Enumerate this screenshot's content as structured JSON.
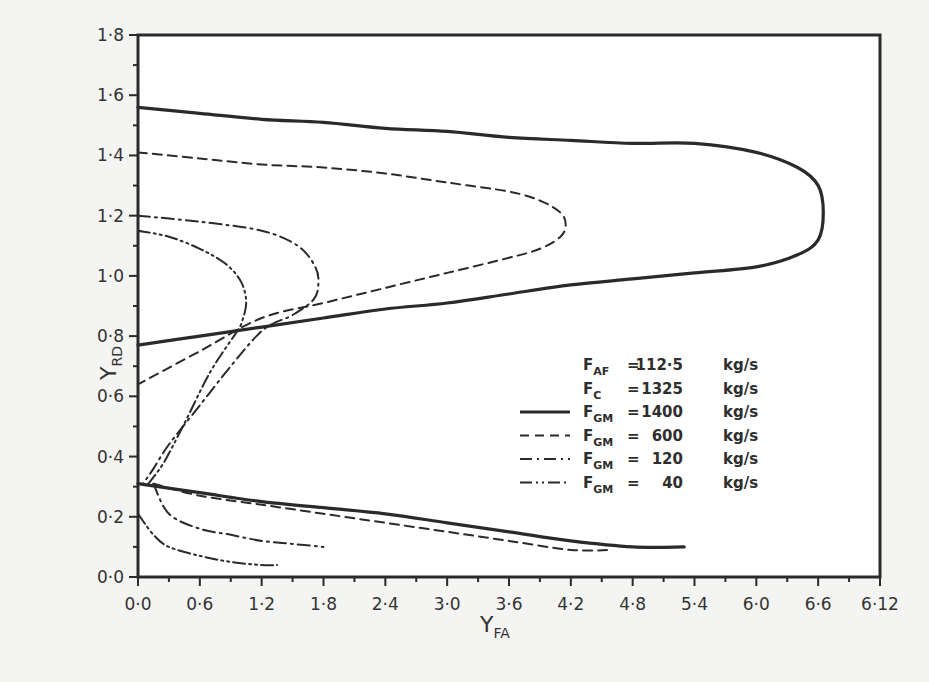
{
  "chart_data": {
    "type": "line",
    "title": "",
    "xlabel": "Y_FA",
    "xlabel_main": "Y",
    "xlabel_sub": "FA",
    "ylabel": "Y_RD",
    "ylabel_main": "Y",
    "ylabel_sub": "RD",
    "xlim": [
      0.0,
      6.12
    ],
    "ylim": [
      0.0,
      1.8
    ],
    "grid": false,
    "legend_position": "inside-right-middle",
    "x_ticks": [
      "0.0",
      "0.6",
      "1.2",
      "1.8",
      "2.4",
      "3.0",
      "3.6",
      "4.2",
      "4.8",
      "5.4",
      "6.0",
      "6.6",
      "6.12"
    ],
    "y_ticks": [
      "0.0",
      "0.2",
      "0.4",
      "0.6",
      "0.8",
      "1.0",
      "1.2",
      "1.4",
      "1.6",
      "1.8"
    ],
    "x_tick_labels_display": [
      "0·0",
      "0·6",
      "1·2",
      "1·8",
      "2·4",
      "3·0",
      "3·6",
      "4·2",
      "4·8",
      "5·4",
      "6·0",
      "6·6",
      "6·12"
    ],
    "y_tick_labels_display": [
      "0·0",
      "0·2",
      "0·4",
      "0·6",
      "0·8",
      "1·0",
      "1·2",
      "1·4",
      "1·6",
      "1·8"
    ],
    "parameters": [
      {
        "symbol": "F",
        "sub": "AF",
        "value": "112·5",
        "unit": "kg/s"
      },
      {
        "symbol": "F",
        "sub": "C",
        "value": "1325",
        "unit": "kg/s"
      }
    ],
    "series": [
      {
        "name": "F_GM = 1400 kg/s",
        "label_value": "1400",
        "style": "solid",
        "branches": [
          {
            "x": [
              0.0,
              0.6,
              1.2,
              1.8,
              2.4,
              3.0,
              3.6,
              4.2,
              4.8,
              5.4,
              6.0,
              6.4,
              6.6,
              6.65,
              6.6,
              6.4,
              6.0,
              5.4,
              4.8,
              4.2,
              3.6,
              3.0,
              2.4,
              1.8,
              1.2,
              0.6,
              0.0
            ],
            "y": [
              1.56,
              1.54,
              1.52,
              1.51,
              1.49,
              1.48,
              1.46,
              1.45,
              1.44,
              1.44,
              1.41,
              1.36,
              1.3,
              1.21,
              1.12,
              1.07,
              1.03,
              1.01,
              0.99,
              0.97,
              0.94,
              0.91,
              0.89,
              0.86,
              0.83,
              0.8,
              0.77
            ]
          },
          {
            "x": [
              0.0,
              0.6,
              1.2,
              1.8,
              2.4,
              3.0,
              3.6,
              4.2,
              4.8,
              5.3
            ],
            "y": [
              0.31,
              0.28,
              0.25,
              0.23,
              0.21,
              0.18,
              0.15,
              0.12,
              0.1,
              0.1
            ]
          }
        ]
      },
      {
        "name": "F_GM = 600 kg/s",
        "label_value": "600",
        "style": "dashed",
        "branches": [
          {
            "x": [
              0.0,
              0.6,
              1.2,
              1.8,
              2.4,
              3.0,
              3.6,
              3.9,
              4.1,
              4.15,
              4.1,
              3.9,
              3.6,
              3.0,
              2.4,
              1.8,
              1.2,
              0.6,
              0.0
            ],
            "y": [
              1.41,
              1.39,
              1.37,
              1.36,
              1.34,
              1.31,
              1.28,
              1.25,
              1.21,
              1.17,
              1.13,
              1.09,
              1.06,
              1.01,
              0.96,
              0.91,
              0.86,
              0.75,
              0.64
            ]
          },
          {
            "x": [
              0.15,
              0.6,
              1.2,
              1.8,
              2.4,
              3.0,
              3.6,
              4.2,
              4.6
            ],
            "y": [
              0.31,
              0.27,
              0.24,
              0.21,
              0.18,
              0.15,
              0.12,
              0.09,
              0.09
            ]
          }
        ]
      },
      {
        "name": "F_GM = 120 kg/s",
        "label_value": "120",
        "style": "dash-dot",
        "branches": [
          {
            "x": [
              0.0,
              0.6,
              1.2,
              1.55,
              1.72,
              1.75,
              1.7,
              1.5,
              1.3,
              1.15,
              0.9,
              0.6,
              0.3,
              0.15,
              0.05
            ],
            "y": [
              1.2,
              1.18,
              1.15,
              1.1,
              1.03,
              0.97,
              0.92,
              0.87,
              0.84,
              0.8,
              0.7,
              0.57,
              0.44,
              0.36,
              0.31
            ]
          },
          {
            "x": [
              0.15,
              0.3,
              0.6,
              0.9,
              1.2,
              1.5,
              1.8
            ],
            "y": [
              0.31,
              0.21,
              0.16,
              0.14,
              0.12,
              0.11,
              0.1
            ]
          }
        ]
      },
      {
        "name": "F_GM = 40 kg/s",
        "label_value": "40",
        "style": "dash-dot-dot",
        "branches": [
          {
            "x": [
              0.0,
              0.3,
              0.6,
              0.85,
              1.0,
              1.05,
              1.0,
              0.95,
              0.7,
              0.45,
              0.25,
              0.1
            ],
            "y": [
              1.15,
              1.13,
              1.09,
              1.04,
              0.98,
              0.91,
              0.84,
              0.81,
              0.68,
              0.51,
              0.38,
              0.31
            ]
          },
          {
            "x": [
              0.0,
              0.15,
              0.3,
              0.6,
              0.9,
              1.2,
              1.35
            ],
            "y": [
              0.21,
              0.14,
              0.1,
              0.07,
              0.05,
              0.04,
              0.04
            ]
          }
        ]
      }
    ]
  },
  "legend": {
    "items": [
      {
        "symbol": "F",
        "sub": "AF",
        "eq": "=",
        "value": "112·5",
        "unit": "kg/s",
        "line": "none"
      },
      {
        "symbol": "F",
        "sub": "C",
        "eq": "=",
        "value": "1325",
        "unit": "kg/s",
        "line": "none"
      },
      {
        "symbol": "F",
        "sub": "GM",
        "eq": "=",
        "value": "1400",
        "unit": "kg/s",
        "line": "solid"
      },
      {
        "symbol": "F",
        "sub": "GM",
        "eq": "=",
        "value": "600",
        "unit": "kg/s",
        "line": "dashed"
      },
      {
        "symbol": "F",
        "sub": "GM",
        "eq": "=",
        "value": "120",
        "unit": "kg/s",
        "line": "dash-dot"
      },
      {
        "symbol": "F",
        "sub": "GM",
        "eq": "=",
        "value": "40",
        "unit": "kg/s",
        "line": "dash-dot-dot"
      }
    ]
  },
  "colors": {
    "ink": "#2a2a2a",
    "paper": "#f4f4f2",
    "plot_bg": "#ffffff"
  }
}
